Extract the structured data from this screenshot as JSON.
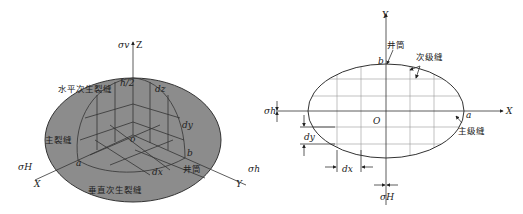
{
  "left_figure": {
    "title": "3D fracture network model",
    "axes": {
      "z": "Z",
      "x": "X",
      "y": "Y",
      "origin": "o"
    },
    "stresses": {
      "vertical": "σv",
      "x_dir": "σH",
      "y_dir": "σh"
    },
    "labels": {
      "horizontal_secondary": "水平次生裂缝",
      "main_fracture": "主裂缝",
      "vertical_secondary": "垂直次生裂缝",
      "wellbore": "井筒"
    },
    "dims": {
      "a": "a",
      "b": "b",
      "h2": "h/2",
      "dx": "dx",
      "dy": "dy",
      "dz": "dz"
    },
    "colors": {
      "ellipse_fill": "#8c8c8c",
      "ellipse_stroke": "#333333"
    }
  },
  "right_figure": {
    "title": "Plan view of fracture network",
    "axes": {
      "x": "X",
      "y": "Y",
      "origin": "O"
    },
    "stresses": {
      "h": "σh",
      "H": "σH"
    },
    "labels": {
      "wellbore": "井筒",
      "secondary": "次级缝",
      "main": "主级缝"
    },
    "dims": {
      "a": "a",
      "b": "b",
      "dy": "dy",
      "dx": "dx"
    },
    "colors": {
      "grid": "#999999",
      "ellipse_stroke": "#333333"
    }
  }
}
